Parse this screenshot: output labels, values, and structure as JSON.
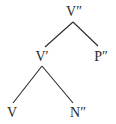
{
  "diagram": {
    "type": "syntax-tree",
    "line_color": "#2a2a2a",
    "nodes": {
      "root": {
        "label": "V″"
      },
      "vbar": {
        "label": "V′"
      },
      "pp": {
        "label": "P″"
      },
      "verb": {
        "label": "V"
      },
      "np": {
        "label": "N″"
      }
    },
    "edges": [
      {
        "from": "V″",
        "to": "V′"
      },
      {
        "from": "V″",
        "to": "P″"
      },
      {
        "from": "V′",
        "to": "V"
      },
      {
        "from": "V′",
        "to": "N″"
      }
    ]
  }
}
